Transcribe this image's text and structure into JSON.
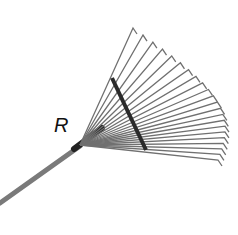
{
  "figure": {
    "label": "R",
    "colors": {
      "handle": "#7a7a7a",
      "tines": "#6a6a6a",
      "crossbar": "#2a2a2a",
      "background": "#ffffff"
    }
  }
}
